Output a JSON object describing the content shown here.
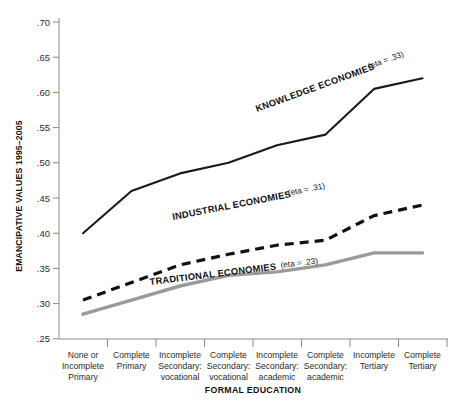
{
  "chart_data": {
    "type": "line",
    "title": "",
    "xlabel": "FORMAL EDUCATION",
    "ylabel": "EMANCIPATIVE VALUES 1995–2005",
    "ylim": [
      0.25,
      0.7
    ],
    "ytick_labels": [
      ".70",
      ".65",
      ".60",
      ".55",
      ".50",
      ".45",
      ".40",
      ".35",
      ".30",
      ".25"
    ],
    "ytick_values": [
      0.7,
      0.65,
      0.6,
      0.55,
      0.5,
      0.45,
      0.4,
      0.35,
      0.3,
      0.25
    ],
    "grid": false,
    "legend_position": "inline-on-lines",
    "categories": [
      "None or\nIncomplete\nPrimary",
      "Complete\nPrimary",
      "Incomplete\nSecondary:\nvocational",
      "Complete\nSecondary:\nvocational",
      "Incomplete\nSecondary:\nacademic",
      "Complete\nSecondary:\nacademic",
      "Incomplete\nTertiary",
      "Complete\nTertiary"
    ],
    "categories_flat": [
      "None or Incomplete Primary",
      "Complete Primary",
      "Incomplete Secondary: vocational",
      "Complete Secondary: vocational",
      "Incomplete Secondary: academic",
      "Complete Secondary: academic",
      "Incomplete Tertiary",
      "Complete Tertiary"
    ],
    "series": [
      {
        "name": "KNOWLEDGE ECONOMIES",
        "eta_text": "(eta = .33)",
        "eta": 0.33,
        "style": "solid",
        "color": "#1a1a1a",
        "width": 2.1,
        "values": [
          0.4,
          0.46,
          0.485,
          0.5,
          0.525,
          0.54,
          0.605,
          0.62
        ]
      },
      {
        "name": "INDUSTRIAL ECONOMIES",
        "eta_text": "(eta = .31)",
        "eta": 0.31,
        "style": "dashed",
        "color": "#111111",
        "width": 3.2,
        "values": [
          0.305,
          0.33,
          0.355,
          0.37,
          0.383,
          0.39,
          0.425,
          0.44
        ]
      },
      {
        "name": "TRADITIONAL ECONOMIES",
        "eta_text": "(eta = .23)",
        "eta": 0.23,
        "style": "solid",
        "color": "#9a9a9a",
        "width": 3.4,
        "values": [
          0.285,
          0.305,
          0.325,
          0.34,
          0.345,
          0.355,
          0.372,
          0.372
        ]
      }
    ]
  },
  "labels": {
    "knowledge_name": "KNOWLEDGE ECONOMIES",
    "knowledge_eta": "(eta = .33)",
    "industrial_name": "INDUSTRIAL ECONOMIES",
    "industrial_eta": "(eta = .31)",
    "traditional_name": "TRADITIONAL ECONOMIES",
    "traditional_eta": "(eta = .23)",
    "y_axis_title": "EMANCIPATIVE VALUES 1995–2005",
    "x_axis_title": "FORMAL EDUCATION"
  },
  "ytick": {
    "t0": ".70",
    "t1": ".65",
    "t2": ".60",
    "t3": ".55",
    "t4": ".50",
    "t5": ".45",
    "t6": ".40",
    "t7": ".35",
    "t8": ".30",
    "t9": ".25"
  },
  "xcat": {
    "c0l0": "None or",
    "c0l1": "Incomplete",
    "c0l2": "Primary",
    "c1l0": "Complete",
    "c1l1": "Primary",
    "c1l2": "",
    "c2l0": "Incomplete",
    "c2l1": "Secondary:",
    "c2l2": "vocational",
    "c3l0": "Complete",
    "c3l1": "Secondary:",
    "c3l2": "vocational",
    "c4l0": "Incomplete",
    "c4l1": "Secondary:",
    "c4l2": "academic",
    "c5l0": "Complete",
    "c5l1": "Secondary:",
    "c5l2": "academic",
    "c6l0": "Incomplete",
    "c6l1": "Tertiary",
    "c6l2": "",
    "c7l0": "Complete",
    "c7l1": "Tertiary",
    "c7l2": ""
  }
}
